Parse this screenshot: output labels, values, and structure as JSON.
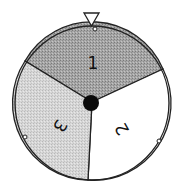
{
  "spinner": {
    "pointer": "triangle-pointer",
    "center": {
      "x": 92,
      "y": 103
    },
    "radius": 77,
    "sectors": [
      {
        "label": "1",
        "color": "#a9a9a9",
        "pattern": "dark-stipple"
      },
      {
        "label": "2",
        "color": "#ffffff",
        "pattern": "none"
      },
      {
        "label": "3",
        "color": "#d4d4d4",
        "pattern": "light-stipple"
      }
    ]
  }
}
